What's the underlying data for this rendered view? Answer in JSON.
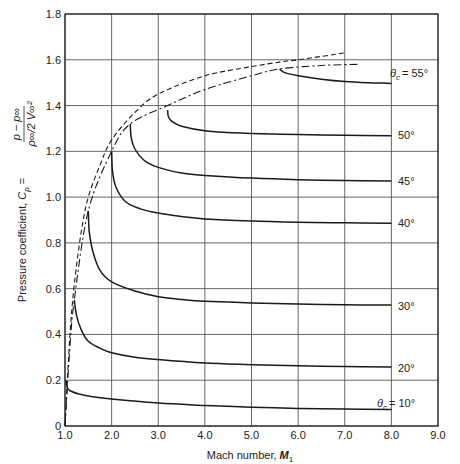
{
  "chart_data": {
    "type": "line",
    "title": "",
    "xlabel": "Mach number, M₁",
    "ylabel": "Pressure coefficient, C_p = (p − p∞) / (ρ∞/2 · V∞²)",
    "xlim": [
      1.0,
      9.0
    ],
    "ylim": [
      0,
      1.8
    ],
    "x_ticks": [
      "1.0",
      "2.0",
      "3.0",
      "4.0",
      "5.0",
      "6.0",
      "7.0",
      "8.0",
      "9.0"
    ],
    "y_ticks": [
      "0",
      "0.2",
      "0.4",
      "0.6",
      "0.8",
      "1.0",
      "1.2",
      "1.4",
      "1.6",
      "1.8"
    ],
    "grid": true,
    "legend": "inline labels at right end of each curve",
    "series": [
      {
        "name": "θc = 10°",
        "label": "θc = 10°",
        "style": "solid",
        "x": [
          1.02,
          1.05,
          1.1,
          1.3,
          1.6,
          2.0,
          3.0,
          4.0,
          5.0,
          6.0,
          7.0,
          8.0
        ],
        "y": [
          0.2,
          0.17,
          0.155,
          0.14,
          0.128,
          0.118,
          0.1,
          0.09,
          0.082,
          0.077,
          0.074,
          0.072
        ]
      },
      {
        "name": "20°",
        "label": "20°",
        "style": "solid",
        "x": [
          1.2,
          1.25,
          1.35,
          1.5,
          1.75,
          2.0,
          2.5,
          3.0,
          4.0,
          5.0,
          6.0,
          7.0,
          8.0
        ],
        "y": [
          0.55,
          0.48,
          0.42,
          0.37,
          0.34,
          0.32,
          0.3,
          0.29,
          0.275,
          0.268,
          0.263,
          0.26,
          0.258
        ]
      },
      {
        "name": "30°",
        "label": "30°",
        "style": "solid",
        "x": [
          1.5,
          1.52,
          1.6,
          1.75,
          2.0,
          2.5,
          3.0,
          3.5,
          4.0,
          5.0,
          6.0,
          7.0,
          8.0
        ],
        "y": [
          0.94,
          0.85,
          0.76,
          0.68,
          0.63,
          0.59,
          0.565,
          0.553,
          0.545,
          0.538,
          0.533,
          0.53,
          0.528
        ]
      },
      {
        "name": "40°",
        "label": "40°",
        "style": "solid",
        "x": [
          2.0,
          2.02,
          2.1,
          2.3,
          2.6,
          3.0,
          3.5,
          4.0,
          5.0,
          6.0,
          7.0,
          8.0
        ],
        "y": [
          1.2,
          1.11,
          1.04,
          0.98,
          0.95,
          0.93,
          0.915,
          0.905,
          0.895,
          0.89,
          0.888,
          0.886
        ]
      },
      {
        "name": "45°",
        "label": "45°",
        "style": "solid",
        "x": [
          2.4,
          2.42,
          2.5,
          2.7,
          3.0,
          3.5,
          4.0,
          5.0,
          6.0,
          7.0,
          8.0
        ],
        "y": [
          1.32,
          1.26,
          1.21,
          1.16,
          1.13,
          1.105,
          1.095,
          1.083,
          1.076,
          1.072,
          1.07
        ]
      },
      {
        "name": "50°",
        "label": "50°",
        "style": "solid",
        "x": [
          3.2,
          3.22,
          3.3,
          3.5,
          4.0,
          4.5,
          5.0,
          6.0,
          7.0,
          8.0
        ],
        "y": [
          1.38,
          1.35,
          1.33,
          1.31,
          1.29,
          1.282,
          1.278,
          1.273,
          1.27,
          1.268
        ]
      },
      {
        "name": "θc = 55°",
        "label": "θc = 55°",
        "style": "solid",
        "x": [
          5.6,
          5.7,
          6.0,
          6.5,
          7.0,
          7.5,
          8.0
        ],
        "y": [
          1.56,
          1.545,
          1.53,
          1.515,
          1.505,
          1.5,
          1.497
        ]
      },
      {
        "name": "dashed boundary",
        "style": "dashed",
        "x": [
          1.0,
          1.1,
          1.2,
          1.35,
          1.5,
          1.75,
          2.0,
          2.5,
          3.0,
          4.0,
          5.0,
          5.6,
          6.0,
          7.0
        ],
        "y": [
          0.0,
          0.38,
          0.62,
          0.85,
          1.0,
          1.14,
          1.25,
          1.37,
          1.45,
          1.53,
          1.57,
          1.59,
          1.6,
          1.63
        ]
      },
      {
        "name": "dash-dot boundary",
        "style": "dash-dot",
        "x": [
          1.0,
          1.1,
          1.2,
          1.5,
          2.0,
          2.4,
          3.2,
          4.0,
          5.0,
          5.6,
          6.5,
          7.3
        ],
        "y": [
          0.0,
          0.33,
          0.55,
          0.94,
          1.2,
          1.32,
          1.4,
          1.47,
          1.53,
          1.56,
          1.575,
          1.58
        ]
      }
    ],
    "annotations": [
      {
        "text": "θc = 55°",
        "near_series": "θc = 55°"
      },
      {
        "text": "50°"
      },
      {
        "text": "45°"
      },
      {
        "text": "40°"
      },
      {
        "text": "30°"
      },
      {
        "text": "20°"
      },
      {
        "text": "θc = 10°"
      }
    ]
  },
  "axes": {
    "xlabel_main": "Mach number, ",
    "xlabel_sym": "M",
    "xlabel_sub": "1",
    "ylabel_main": "Pressure coefficient, ",
    "ylabel_sym": "C",
    "ylabel_sub": "p",
    "ylabel_eq": " = ",
    "frac_num": "p − p∞",
    "frac_den": "ρ∞/2 V∞²"
  },
  "labels": {
    "l55": "= 55°",
    "l50": "50°",
    "l45": "45°",
    "l40": "40°",
    "l30": "30°",
    "l20": "20°",
    "l10": "= 10°",
    "theta": "θ",
    "theta_sub": "c"
  }
}
